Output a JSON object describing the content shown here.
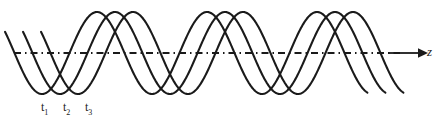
{
  "figure": {
    "background_color": "#ffffff",
    "stroke_color": "#1a1a1a"
  },
  "axis": {
    "name": "z-axis",
    "label": "z",
    "line_style": "dash-dot",
    "arrow": "right-arrow",
    "y_position": 53,
    "x_start": 14,
    "x_end": 400,
    "arrow_tip_x": 424
  },
  "labels": {
    "t1": {
      "base": "t",
      "sub": "1",
      "x": 41,
      "y": 101
    },
    "t2": {
      "base": "t",
      "sub": "2",
      "x": 63,
      "y": 101
    },
    "t3": {
      "base": "t",
      "sub": "3",
      "x": 85,
      "y": 101
    }
  },
  "chart_data": {
    "type": "line",
    "xlabel": "z",
    "ylabel": "",
    "grid": false,
    "legend": "none",
    "axis_y_pixel": 53,
    "amplitude_pixels": 41,
    "wavelength_pixels": 110,
    "x_domain_pixels": [
      5,
      368
    ],
    "series": [
      {
        "name": "t1",
        "label": "t₁",
        "phase_shift_pixels": 0,
        "color": "#1a1a1a",
        "line_width": 2.1,
        "description": "wave at time t1; first trough near z = 43 px, first crest near z = 97 px"
      },
      {
        "name": "t2",
        "label": "t₂",
        "phase_shift_pixels": 18,
        "color": "#1a1a1a",
        "line_width": 2.1,
        "description": "wave at time t2; shifted right by one fifth wavelength relative to t1"
      },
      {
        "name": "t3",
        "label": "t₃",
        "phase_shift_pixels": 36,
        "color": "#1a1a1a",
        "line_width": 2.1,
        "description": "wave at time t3; shifted right by two fifths wavelength relative to t1"
      }
    ],
    "crest_positions_pixels": {
      "t1": [
        97,
        207,
        317
      ],
      "t2": [
        115,
        225,
        335
      ],
      "t3": [
        133,
        243,
        353
      ]
    },
    "trough_positions_pixels": {
      "t1": [
        42,
        152,
        262
      ],
      "t2": [
        60,
        170,
        280
      ],
      "t3": [
        78,
        188,
        298
      ]
    }
  }
}
